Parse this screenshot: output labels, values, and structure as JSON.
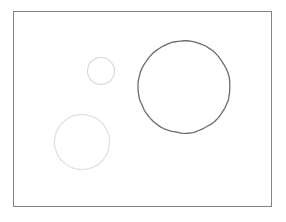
{
  "figure": {
    "canvas": {
      "width": 286,
      "height": 222,
      "background_color": "#ffffff"
    },
    "frame": {
      "name": "plot-border",
      "x": 13.5,
      "y": 11.5,
      "width": 258,
      "height": 195,
      "stroke_color": "#838383",
      "stroke_width": 1,
      "fill": "none"
    },
    "shapes": [
      {
        "name": "small-circle",
        "label": "small light circle",
        "cx": 101,
        "cy": 71,
        "r": 13.5,
        "diameter": 27,
        "stroke_color": "#d6d6d6",
        "stroke_width": 1.1,
        "fill": "none"
      },
      {
        "name": "medium-circle",
        "label": "medium light circle",
        "cx": 82,
        "cy": 142,
        "r": 27.5,
        "diameter": 55,
        "stroke_color": "#e2e2e2",
        "stroke_width": 1.4,
        "fill": "none"
      },
      {
        "name": "large-circle",
        "label": "large dark circle",
        "cx": 184,
        "cy": 87,
        "r": 46,
        "diameter": 92,
        "stroke_color": "#6b6b6b",
        "stroke_width": 1.3,
        "fill": "none"
      }
    ]
  },
  "chart_data": {
    "type": "scatter",
    "title": "",
    "subtitle": "",
    "xlabel": "",
    "ylabel": "",
    "xlim": [
      13,
      272
    ],
    "ylim": [
      11,
      207
    ],
    "grid": false,
    "legend": "none",
    "tick_labels_x": [],
    "tick_labels_y": [],
    "annotations": [],
    "series": [
      {
        "name": "circles",
        "marker": "open-circle",
        "points": [
          {
            "label": "small-circle",
            "x": 101,
            "y": 71,
            "size": 27,
            "color": "#d6d6d6"
          },
          {
            "label": "medium-circle",
            "x": 82,
            "y": 142,
            "size": 55,
            "color": "#e2e2e2"
          },
          {
            "label": "large-circle",
            "x": 184,
            "y": 87,
            "size": 92,
            "color": "#6b6b6b"
          }
        ]
      }
    ]
  }
}
